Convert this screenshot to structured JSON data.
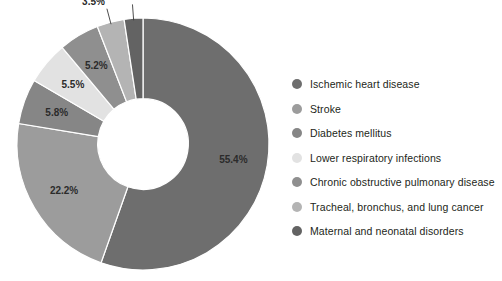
{
  "chart_data": {
    "type": "pie",
    "variant": "donut",
    "title": "",
    "subtitle": "",
    "xlabel": "",
    "ylabel": "",
    "grid": false,
    "legend_position": "right",
    "start_angle_deg": 0,
    "direction": "clockwise",
    "inner_radius_ratio": 0.36,
    "value_unit": "%",
    "categories": [
      "Ischemic heart disease",
      "Stroke",
      "Diabetes mellitus",
      "Lower respiratory infections",
      "Chronic obstructive pulmonary disease",
      "Tracheal, bronchus, and lung cancer",
      "Maternal and neonatal disorders"
    ],
    "values": [
      55.4,
      22.2,
      5.8,
      5.5,
      5.2,
      3.5,
      2.4
    ],
    "data_labels": [
      "55.4%",
      "22.2%",
      "5.8%",
      "5.5%",
      "5.2%",
      "3.5%",
      "2.4%"
    ],
    "colors": [
      "#6e6e6e",
      "#9c9c9c",
      "#868686",
      "#e2e2e2",
      "#8f8f8f",
      "#b4b4b4",
      "#636363"
    ],
    "label_placement": [
      "inside",
      "inside",
      "inside",
      "inside",
      "inside",
      "outside",
      "outside"
    ],
    "label_text_colors": [
      "#ffffff",
      "#2b2b2b",
      "#2b2b2b",
      "#2b2b2b",
      "#2b2b2b",
      "#2b2b2b",
      "#2b2b2b"
    ]
  },
  "legend": {
    "items": [
      {
        "label": "Ischemic heart disease",
        "color": "#6e6e6e"
      },
      {
        "label": "Stroke",
        "color": "#9c9c9c"
      },
      {
        "label": "Diabetes mellitus",
        "color": "#868686"
      },
      {
        "label": "Lower respiratory infections",
        "color": "#e2e2e2"
      },
      {
        "label": "Chronic obstructive pulmonary disease",
        "color": "#8f8f8f"
      },
      {
        "label": "Tracheal, bronchus, and lung cancer",
        "color": "#b4b4b4"
      },
      {
        "label": "Maternal and neonatal disorders",
        "color": "#636363"
      }
    ]
  }
}
